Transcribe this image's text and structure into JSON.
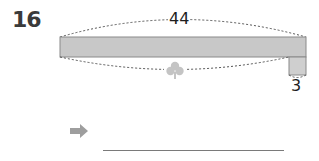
{
  "problem": {
    "number": "16",
    "long_length_label": "44",
    "short_length_label": "3",
    "unknown_icon": "clover-icon",
    "answer_arrow_icon": "arrow-right-icon",
    "answer_value": ""
  },
  "colors": {
    "bar_fill": "#c8c8c8",
    "bar_stroke": "#8a8a8a",
    "dashed_curve": "#555555",
    "clover": "#c4c4c4",
    "arrow": "#9e9e9e",
    "answer_line": "#7a7a7a"
  }
}
